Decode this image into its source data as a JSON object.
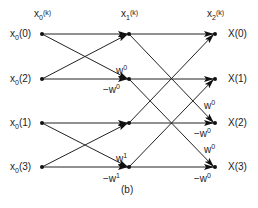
{
  "diagram": {
    "type": "butterfly-flow-graph",
    "caption": "(b)",
    "columns": [
      {
        "id": "c0",
        "header": {
          "base": "x",
          "sub": "0",
          "arg": "(k)"
        },
        "x": 42
      },
      {
        "id": "c1",
        "header": {
          "base": "x",
          "sub": "1",
          "arg": "(k)"
        },
        "x": 129
      },
      {
        "id": "c2",
        "header": {
          "base": "x",
          "sub": "2",
          "arg": "(k)"
        },
        "x": 215
      }
    ],
    "rows_y": [
      34,
      79,
      123,
      167
    ],
    "inputs": [
      {
        "base": "x",
        "sub": "0",
        "arg": "(0)"
      },
      {
        "base": "x",
        "sub": "0",
        "arg": "(2)"
      },
      {
        "base": "x",
        "sub": "0",
        "arg": "(1)"
      },
      {
        "base": "x",
        "sub": "0",
        "arg": "(3)"
      }
    ],
    "outputs": [
      "X(0)",
      "X(1)",
      "X(2)",
      "X(3)"
    ],
    "weights": {
      "stage1": [
        {
          "row": 1,
          "top": "w",
          "top_exp": "0",
          "bottom": "−w",
          "bottom_exp": "0"
        },
        {
          "row": 3,
          "top": "w",
          "top_exp": "1",
          "bottom": "−w",
          "bottom_exp": "1"
        }
      ],
      "stage2": [
        {
          "row": 2,
          "top": "w",
          "top_exp": "0",
          "bottom": "−w",
          "bottom_exp": "0"
        },
        {
          "row": 3,
          "top": "w",
          "top_exp": "0",
          "bottom": "−w",
          "bottom_exp": "0"
        }
      ]
    },
    "edges_stage1": [
      [
        0,
        0
      ],
      [
        0,
        1
      ],
      [
        1,
        0
      ],
      [
        1,
        1
      ],
      [
        2,
        2
      ],
      [
        2,
        3
      ],
      [
        3,
        2
      ],
      [
        3,
        3
      ]
    ],
    "edges_stage2": [
      [
        0,
        0
      ],
      [
        0,
        2
      ],
      [
        1,
        1
      ],
      [
        1,
        3
      ],
      [
        2,
        0
      ],
      [
        2,
        2
      ],
      [
        3,
        1
      ],
      [
        3,
        3
      ]
    ]
  }
}
